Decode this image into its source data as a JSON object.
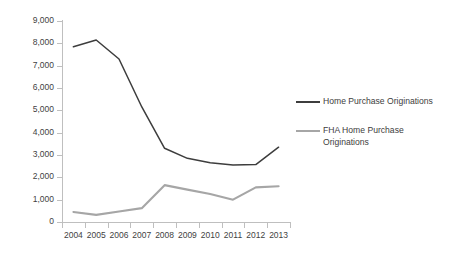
{
  "chart_data": {
    "type": "line",
    "title": "",
    "subtitle": "",
    "xlabel": "",
    "ylabel": "",
    "categories": [
      "2004",
      "2005",
      "2006",
      "2007",
      "2008",
      "2009",
      "2010",
      "2011",
      "2012",
      "2013"
    ],
    "ylim": [
      0,
      9000
    ],
    "ytick_labels": [
      "0",
      "1,000",
      "2,000",
      "3,000",
      "4,000",
      "5,000",
      "6,000",
      "7,000",
      "8,000",
      "9,000"
    ],
    "ytick_values": [
      0,
      1000,
      2000,
      3000,
      4000,
      5000,
      6000,
      7000,
      8000,
      9000
    ],
    "grid": false,
    "legend_position": "right",
    "series": [
      {
        "name": "Home Purchase Originations",
        "color": "#3d3d3d",
        "values": [
          7850,
          8150,
          7300,
          5150,
          3300,
          2850,
          2650,
          2550,
          2570,
          3350
        ]
      },
      {
        "name": "FHA Home Purchase Originations",
        "color": "#a6a6a6",
        "values": [
          450,
          320,
          470,
          620,
          1650,
          1450,
          1250,
          1000,
          1550,
          1600
        ]
      }
    ]
  },
  "legend": {
    "entries": [
      {
        "label": "Home Purchase Originations",
        "swatch": "line-swatch-dark"
      },
      {
        "label": "FHA Home Purchase Originations",
        "swatch": "line-swatch-gray"
      }
    ]
  }
}
